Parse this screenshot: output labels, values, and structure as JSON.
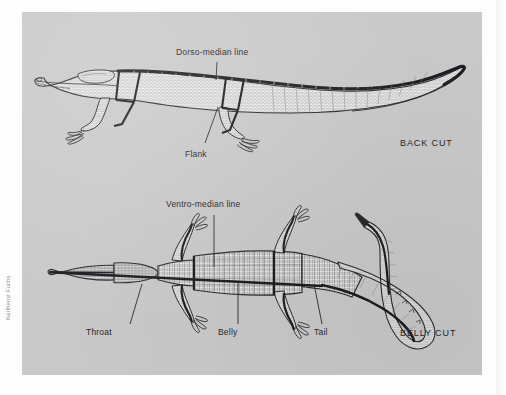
{
  "page": {
    "background_color": "#fdfdfd",
    "plate_color": "#c9c9c9",
    "ink_color": "#2b2b30"
  },
  "credit": {
    "text": "Karlheinz Fuchs"
  },
  "figures": [
    {
      "id": "back-cut",
      "name": "crocodile-lateral-back-cut",
      "cut_label": "BACK CUT",
      "view": "lateral",
      "labels": [
        {
          "name": "dorso-median-line",
          "text": "Dorso-median line"
        },
        {
          "name": "flank",
          "text": "Flank"
        }
      ]
    },
    {
      "id": "belly-cut",
      "name": "crocodile-ventral-belly-cut",
      "cut_label": "BELLY CUT",
      "view": "ventral",
      "labels": [
        {
          "name": "ventro-median-line",
          "text": "Ventro-median line"
        },
        {
          "name": "throat",
          "text": "Throat"
        },
        {
          "name": "belly",
          "text": "Belly"
        },
        {
          "name": "tail",
          "text": "Tail"
        }
      ]
    }
  ]
}
